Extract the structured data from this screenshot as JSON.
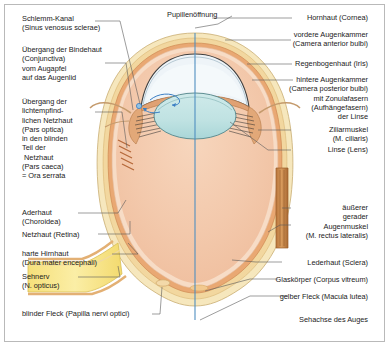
{
  "figure": {
    "language": "de",
    "border_color": "#b9b9b9",
    "background": "#ffffff",
    "text_color": "#1b1b1b",
    "leader_line_color": "#555555"
  },
  "palette": {
    "sclera": "#f6e7bd",
    "sclera_edge": "#e3cf96",
    "choroid": "#e8a06a",
    "retina": "#f6d9c0",
    "vitreous": "#f3c8ab",
    "vitreous_top": "#f0bfa2",
    "lens": "#bfe2e2",
    "lens_edge": "#5f8f93",
    "cornea_fill": "#eef4f8",
    "cornea_edge": "#4a4a4a",
    "iris": "#e0a173",
    "muscle": "#c07c3f",
    "optic_nerve": "#f7e58a",
    "aqueous_arrow": "#3b7fc4",
    "axis_line": "#4f8fc0"
  },
  "labels": {
    "top": [
      {
        "id": "pupillenoeffnung",
        "name": "pupil-opening",
        "lines": [
          "Pupillenöffnung"
        ]
      }
    ],
    "left": [
      {
        "id": "schlemm_kanal",
        "name": "schlemms-canal",
        "lines": [
          "Schlemm-Kanal",
          "(Sinus venosus sclerae)"
        ]
      },
      {
        "id": "uebergang_bindehaut",
        "name": "conjunctiva-transition",
        "lines": [
          "Übergang der Bindehaut",
          "(Conjunctiva)",
          "vom Augapfel",
          "auf das Augenlid"
        ]
      },
      {
        "id": "ora_serrata",
        "name": "ora-serrata",
        "lines": [
          "Übergang der",
          "lichtempfind-",
          "lichen Netzhaut",
          "(Pars optica)",
          "in den blinden",
          "Teil der",
          " Netzhaut",
          "(Pars caeca)",
          "= Ora serrata"
        ]
      },
      {
        "id": "aderhaut",
        "name": "choroid",
        "lines": [
          "Aderhaut",
          "(Choroidea)"
        ]
      },
      {
        "id": "netzhaut",
        "name": "retina",
        "lines": [
          "Netzhaut (Retina)"
        ]
      },
      {
        "id": "harte_hirnhaut",
        "name": "dura-mater",
        "lines": [
          "harte Hirnhaut",
          "(Dura mater encephali)"
        ]
      },
      {
        "id": "sehnerv",
        "name": "optic-nerve",
        "lines": [
          "Sehnerv",
          "(N. opticus)"
        ]
      },
      {
        "id": "blinder_fleck",
        "name": "blind-spot",
        "lines": [
          "blinder Fleck (Papilla nervi optici)"
        ]
      }
    ],
    "right": [
      {
        "id": "hornhaut",
        "name": "cornea",
        "lines": [
          "Hornhaut (Cornea)"
        ]
      },
      {
        "id": "vordere_augenkammer",
        "name": "anterior-chamber",
        "lines": [
          "vordere Augenkammer",
          "(Camera anterior bulbi)"
        ]
      },
      {
        "id": "regenbogenhaut",
        "name": "iris",
        "lines": [
          "Regenbogenhaut (Iris)"
        ]
      },
      {
        "id": "hintere_augenkammer",
        "name": "posterior-chamber",
        "lines": [
          "hintere Augenkammer",
          "(Camera posterior bulbi)",
          "mit Zonulafasern",
          "(Aufhängefasern)",
          "der Linse"
        ]
      },
      {
        "id": "ziliarmuskel",
        "name": "ciliary-muscle",
        "lines": [
          "Ziliarmuskel",
          "(M. ciliaris)"
        ]
      },
      {
        "id": "linse",
        "name": "lens",
        "lines": [
          "Linse (Lens)"
        ]
      },
      {
        "id": "augenmuskel",
        "name": "lateral-rectus-muscle",
        "lines": [
          "äußerer",
          "gerader",
          "Augenmuskel",
          "(M. rectus lateralis)"
        ]
      },
      {
        "id": "lederhaut",
        "name": "sclera",
        "lines": [
          "Lederhaut (Sclera)"
        ]
      },
      {
        "id": "glaskoerper",
        "name": "vitreous-body",
        "lines": [
          "Glaskörper (Corpus vitreum)"
        ]
      },
      {
        "id": "gelber_fleck",
        "name": "macula-lutea",
        "lines": [
          "gelber Fleck (Macula lutea)"
        ]
      },
      {
        "id": "sehachse",
        "name": "visual-axis",
        "lines": [
          "Sehachse des Auges"
        ]
      }
    ]
  }
}
